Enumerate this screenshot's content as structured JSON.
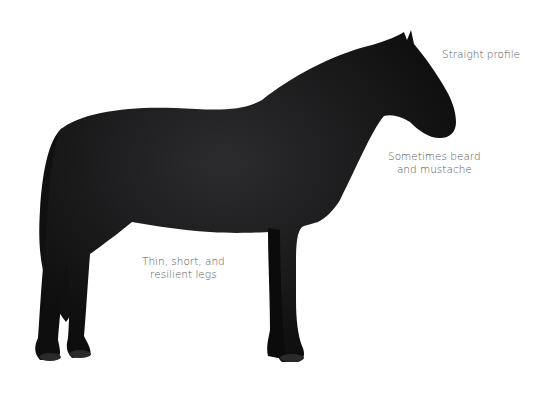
{
  "image": {
    "subject": "Black horse standing in profile",
    "background_color": "#ffffff",
    "coat_color": "#141414"
  },
  "annotations": [
    {
      "id": "profile",
      "lines": [
        "Straight profile"
      ]
    },
    {
      "id": "beard",
      "lines": [
        "Sometimes beard",
        "and mustache"
      ]
    },
    {
      "id": "legs",
      "lines": [
        "Thin, short, and",
        "resilient legs"
      ]
    }
  ]
}
